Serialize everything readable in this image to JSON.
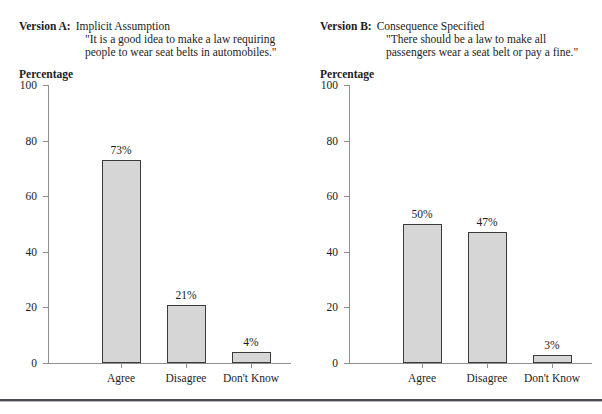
{
  "figure": {
    "ghost_text": "· · · ·",
    "bottom_rule_color": "#4a4a52"
  },
  "panels": [
    {
      "id": "version-a",
      "version_label": "Version A:",
      "version_name": "Implicit Assumption",
      "quote_line_1": "\"It is a good idea to make a law requiring",
      "quote_line_2": "people to wear seat belts in automobiles.\"",
      "axis_title": "Percentage",
      "chart_data": {
        "type": "bar",
        "title": "Version A: Implicit Assumption",
        "categories": [
          "Agree",
          "Disagree",
          "Don't Know"
        ],
        "values": [
          73,
          21,
          4
        ],
        "data_labels": [
          "73%",
          "21%",
          "4%"
        ],
        "xlabel": "",
        "ylabel": "Percentage",
        "ylim": [
          0,
          100
        ],
        "yticks": [
          0,
          20,
          40,
          60,
          80,
          100
        ],
        "ytick_labels": [
          "0",
          "20",
          "40",
          "60",
          "80",
          "100"
        ],
        "grid": false,
        "legend": false,
        "bar_fill": "#d6d6d6",
        "bar_edge": "#3a3a3a"
      }
    },
    {
      "id": "version-b",
      "version_label": "Version B:",
      "version_name": "Consequence Specified",
      "quote_line_1": "\"There should be a law to make all",
      "quote_line_2": "passengers wear a seat belt or pay a fine.\"",
      "axis_title": "Percentage",
      "chart_data": {
        "type": "bar",
        "title": "Version B: Consequence Specified",
        "categories": [
          "Agree",
          "Disagree",
          "Don't Know"
        ],
        "values": [
          50,
          47,
          3
        ],
        "data_labels": [
          "50%",
          "47%",
          "3%"
        ],
        "xlabel": "",
        "ylabel": "Percentage",
        "ylim": [
          0,
          100
        ],
        "yticks": [
          0,
          20,
          40,
          60,
          80,
          100
        ],
        "ytick_labels": [
          "0",
          "20",
          "40",
          "60",
          "80",
          "100"
        ],
        "grid": false,
        "legend": false,
        "bar_fill": "#d6d6d6",
        "bar_edge": "#3a3a3a"
      }
    }
  ]
}
